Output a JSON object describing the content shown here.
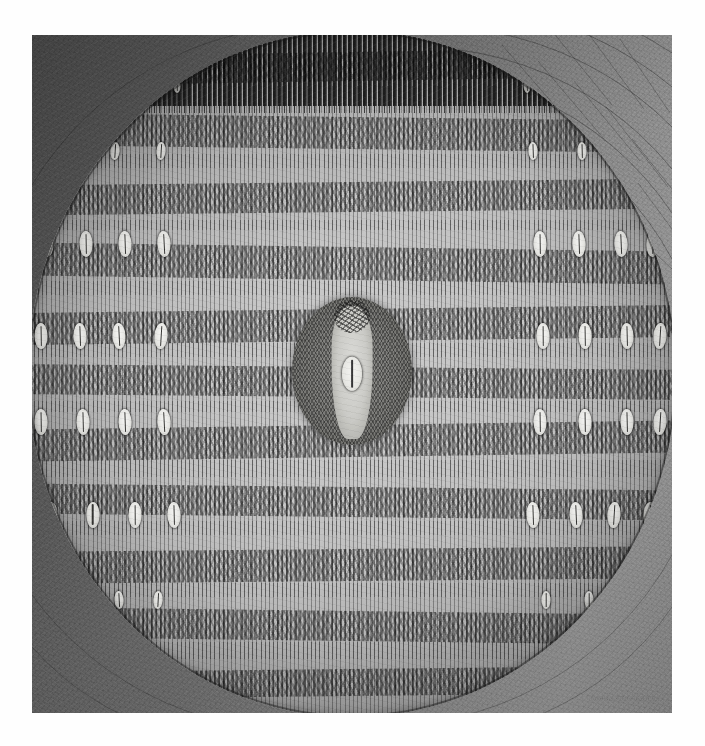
{
  "artwork": {
    "medium_appearance": "monochrome graphite / ink drawing on toned paper",
    "title_visible": "",
    "signature": "illegible artist signature",
    "palette": {
      "paper_light": "#c9c9c9",
      "paper_mid": "#8a8a8a",
      "paper_dark": "#4f4f4f",
      "stroke_black": "#232323",
      "cowrie_white": "#f2f2f0",
      "medallion_grey": "#7a7a77"
    },
    "plate": {
      "left": 32,
      "top": 35,
      "width": 640,
      "height": 678
    },
    "composition": {
      "background_label": "corner field with concentric arc and radial hatch, masonry-like",
      "disc_label": "large central disc filled with horizontal registers of vertical tally strokes",
      "medallion_label": "dark oval medallion at centre containing a pale vertical figure and a white lens form"
    },
    "bands": [
      {
        "y": 3.0,
        "h": 4.2,
        "rot": -0.9
      },
      {
        "y": 12.5,
        "h": 4.6,
        "rot": 0.7
      },
      {
        "y": 22.0,
        "h": 4.4,
        "rot": -0.6
      },
      {
        "y": 31.5,
        "h": 4.8,
        "rot": 0.8
      },
      {
        "y": 40.5,
        "h": 4.6,
        "rot": -0.7
      },
      {
        "y": 49.0,
        "h": 4.4,
        "rot": 0.5
      },
      {
        "y": 57.5,
        "h": 4.6,
        "rot": -0.8
      },
      {
        "y": 66.5,
        "h": 4.4,
        "rot": 0.6
      },
      {
        "y": 75.5,
        "h": 4.6,
        "rot": -0.5
      },
      {
        "y": 84.5,
        "h": 4.4,
        "rot": 0.7
      },
      {
        "y": 93.0,
        "h": 4.0,
        "rot": -0.6
      }
    ],
    "cowrie_rows": [
      {
        "y": 17.5,
        "xs": [
          6.5,
          13.5,
          20.5,
          78.0,
          85.5,
          92.0
        ],
        "size": "sm"
      },
      {
        "y": 31.0,
        "xs": [
          3.0,
          9.0,
          15.0,
          21.0,
          79.0,
          85.0,
          91.5,
          96.5
        ],
        "size": ""
      },
      {
        "y": 44.5,
        "xs": [
          2.0,
          8.0,
          14.0,
          20.5,
          79.5,
          86.0,
          92.5,
          97.5
        ],
        "size": ""
      },
      {
        "y": 57.0,
        "xs": [
          2.0,
          8.5,
          15.0,
          21.0,
          79.0,
          86.0,
          92.5,
          97.5
        ],
        "size": ""
      },
      {
        "y": 70.5,
        "xs": [
          3.5,
          10.0,
          16.5,
          22.5,
          78.0,
          84.5,
          90.5,
          96.0
        ],
        "size": ""
      },
      {
        "y": 83.0,
        "xs": [
          7.5,
          14.0,
          20.0,
          80.0,
          86.5,
          92.0
        ],
        "size": "sm"
      },
      {
        "y": 92.5,
        "xs": [
          14.0,
          21.0,
          79.5,
          86.0
        ],
        "size": "xs"
      },
      {
        "y": 8.0,
        "xs": [
          16.0,
          23.0,
          77.0,
          83.5
        ],
        "size": "xs"
      }
    ],
    "tally_registers": [
      {
        "y": 0.0,
        "h": 11.0
      },
      {
        "y": 8.0,
        "h": 12.0
      },
      {
        "y": 18.0,
        "h": 11.0
      },
      {
        "y": 27.5,
        "h": 11.0
      },
      {
        "y": 36.5,
        "h": 11.0
      },
      {
        "y": 45.5,
        "h": 10.0
      },
      {
        "y": 54.0,
        "h": 11.0
      },
      {
        "y": 62.5,
        "h": 11.0
      },
      {
        "y": 71.5,
        "h": 11.0
      },
      {
        "y": 80.5,
        "h": 11.0
      },
      {
        "y": 89.0,
        "h": 11.0
      }
    ]
  }
}
